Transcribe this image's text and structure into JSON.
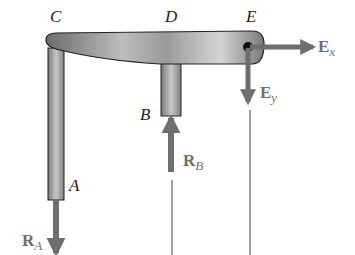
{
  "diagram": {
    "type": "free-body-diagram",
    "points": {
      "C": "C",
      "D": "D",
      "E": "E",
      "B": "B",
      "A": "A"
    },
    "forces": {
      "Ex": {
        "symbol": "E",
        "sub": "x",
        "direction": "right"
      },
      "Ey": {
        "symbol": "E",
        "sub": "y",
        "direction": "down"
      },
      "RB": {
        "symbol": "R",
        "sub": "B",
        "direction": "up"
      },
      "RA": {
        "symbol": "R",
        "sub": "A",
        "direction": "down"
      }
    },
    "colors": {
      "member": "#8a8a8a",
      "arrow": "#6e6e6e",
      "label": "#222222",
      "line": "#333333"
    }
  }
}
